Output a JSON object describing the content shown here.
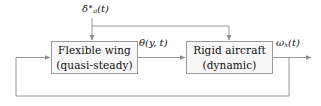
{
  "diagram": {
    "type": "control-block-diagram",
    "background_color": "#ffffff",
    "line_color": "#8c8c8c",
    "block_fill": "#f7f7f7",
    "block_border": "#9a9a9a",
    "text_color": "#111111"
  },
  "blocks": [
    {
      "id": "flexible-wing",
      "line1": "Flexible wing",
      "line2": "(quasi-steady)"
    },
    {
      "id": "rigid-aircraft",
      "line1": "Rigid aircraft",
      "line2": "(dynamic)"
    }
  ],
  "signals": {
    "input": {
      "id": "delta-a-star",
      "base": "δ",
      "subscript": "a",
      "superscript": "∗",
      "argument": "(t)"
    },
    "coupling": {
      "id": "theta",
      "base": "θ",
      "subscript": "",
      "superscript": "",
      "argument": "(y, t)"
    },
    "output": {
      "id": "omega-x",
      "base": "ω",
      "subscript": "x",
      "superscript": "",
      "argument": "(t)"
    }
  },
  "wires": [
    {
      "id": "input-trunk-vertical",
      "desc": "delta_a star drops from label to fan-out bus"
    },
    {
      "id": "input-fanout-bus",
      "desc": "horizontal bus feeding both blocks"
    },
    {
      "id": "input-to-flexible-wing",
      "desc": "arrow down into flexible wing block"
    },
    {
      "id": "input-to-rigid-aircraft",
      "desc": "arrow down into rigid aircraft block"
    },
    {
      "id": "theta-coupling",
      "desc": "flexible wing output to rigid aircraft input"
    },
    {
      "id": "omega-output",
      "desc": "rigid aircraft output to the right"
    },
    {
      "id": "feedback-path",
      "desc": "omega_x fed back around to flexible wing input"
    }
  ]
}
